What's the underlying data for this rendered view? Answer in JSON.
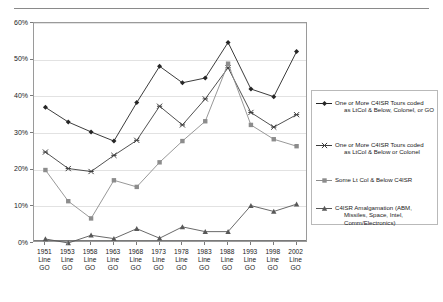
{
  "page": {
    "header_ghost": "",
    "background": "#ffffff"
  },
  "chart_data": {
    "type": "line",
    "title": "",
    "subtitle": "",
    "xlabel": "",
    "ylabel": "",
    "ylim": [
      0,
      60
    ],
    "ytick_values": [
      0,
      10,
      20,
      30,
      40,
      50,
      60
    ],
    "ytick_labels": [
      "0%",
      "10%",
      "20%",
      "30%",
      "40%",
      "50%",
      "60%"
    ],
    "grid": true,
    "legend_position": "right",
    "categories": [
      "1951 Line GO",
      "1953 Line GO",
      "1958 Line GO",
      "1963 Line GO",
      "1968 Line GO",
      "1973 Line GO",
      "1978 Line GO",
      "1983 Line GO",
      "1988 Line GO",
      "1993 Line GO",
      "1998 Line GO",
      "2002 Line GO"
    ],
    "category_lines": [
      [
        "1951",
        "Line",
        "GO"
      ],
      [
        "1953",
        "Line",
        "GO"
      ],
      [
        "1958",
        "Line",
        "GO"
      ],
      [
        "1963",
        "Line",
        "GO"
      ],
      [
        "1968",
        "Line",
        "GO"
      ],
      [
        "1973",
        "Line",
        "GO"
      ],
      [
        "1978",
        "Line",
        "GO"
      ],
      [
        "1983",
        "Line",
        "GO"
      ],
      [
        "1988",
        "Line",
        "GO"
      ],
      [
        "1993",
        "Line",
        "GO"
      ],
      [
        "1998",
        "Line",
        "GO"
      ],
      [
        "2002",
        "Line",
        "GO"
      ]
    ],
    "series": [
      {
        "name": "One or More C4ISR Tours coded as LtCol & Below, Colonel, or GO",
        "name_line1": "One or More C4ISR Tours coded",
        "name_line2": "as LtCol & Below, Colonel, or GO",
        "marker": "diamond",
        "color": "#262626",
        "values": [
          37.0,
          33.0,
          30.3,
          27.8,
          38.3,
          48.2,
          43.7,
          45.0,
          54.7,
          42.0,
          39.9,
          52.2
        ]
      },
      {
        "name": "One or More C4ISR Tours coded as LtCol & Below or Colonel",
        "name_line1": "One or More C4ISR Tours coded",
        "name_line2": "as LtCol & Below or Colonel",
        "marker": "cross",
        "color": "#3d3d3d",
        "values": [
          24.8,
          20.3,
          19.5,
          23.9,
          28.0,
          37.3,
          32.2,
          39.3,
          47.8,
          35.6,
          31.6,
          35.0
        ]
      },
      {
        "name": "Some Lt Col & Below C4ISR",
        "name_line1": "Some Lt Col & Below C4ISR",
        "name_line2": "",
        "marker": "square",
        "color": "#8c8c8c",
        "values": [
          19.9,
          11.4,
          6.7,
          17.1,
          15.3,
          22.0,
          27.8,
          33.2,
          48.9,
          32.2,
          28.3,
          26.4
        ]
      },
      {
        "name": "C4ISR Amalgamation (ABM, Missiles, Space, Intel, Comm/Electronics)",
        "name_line1": "C4ISR Amalgamation (ABM,",
        "name_line2": "Missiles, Space, Intel,",
        "name_line3": "Comm/Electronics)",
        "marker": "triangle",
        "color": "#585858",
        "values": [
          1.1,
          0.0,
          2.1,
          1.2,
          3.9,
          1.3,
          4.4,
          3.1,
          3.1,
          10.2,
          8.6,
          10.6
        ]
      }
    ]
  }
}
